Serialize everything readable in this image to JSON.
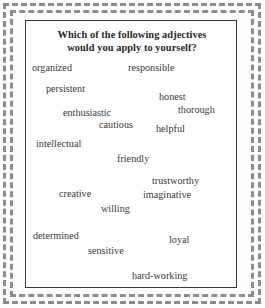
{
  "page": {
    "background_color": "#fefefe",
    "frame_color": "#8d8d8d",
    "card_border_color": "#3b3b3b",
    "text_color": "#3a3a3a",
    "title_color": "#2a2a2a"
  },
  "card": {
    "title": {
      "line1": "Which of the following adjectives",
      "line2": "would you apply to yourself?"
    },
    "adjectives": [
      {
        "label": "organized",
        "x": 6,
        "y": 41
      },
      {
        "label": "responsible",
        "x": 102,
        "y": 41
      },
      {
        "label": "persistent",
        "x": 20,
        "y": 62
      },
      {
        "label": "honest",
        "x": 133,
        "y": 70
      },
      {
        "label": "enthusiastic",
        "x": 37,
        "y": 86
      },
      {
        "label": "thorough",
        "x": 152,
        "y": 83
      },
      {
        "label": "cautious",
        "x": 73,
        "y": 98
      },
      {
        "label": "helpful",
        "x": 130,
        "y": 102
      },
      {
        "label": "intellectual",
        "x": 10,
        "y": 117
      },
      {
        "label": "friendly",
        "x": 91,
        "y": 132
      },
      {
        "label": "trustworthy",
        "x": 126,
        "y": 154
      },
      {
        "label": "creative",
        "x": 33,
        "y": 167
      },
      {
        "label": "imaginative",
        "x": 117,
        "y": 168
      },
      {
        "label": "willing",
        "x": 75,
        "y": 182
      },
      {
        "label": "determined",
        "x": 7,
        "y": 209
      },
      {
        "label": "loyal",
        "x": 143,
        "y": 213
      },
      {
        "label": "sensitive",
        "x": 62,
        "y": 224
      },
      {
        "label": "hard-working",
        "x": 106,
        "y": 249
      }
    ]
  }
}
